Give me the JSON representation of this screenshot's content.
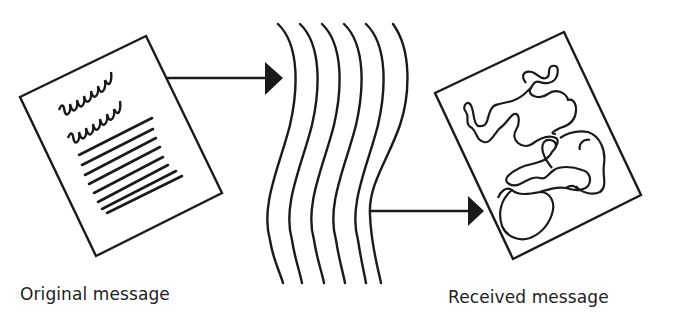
{
  "figure": {
    "type": "communication-noise-diagram",
    "colors": {
      "ink": "#1a1a1a",
      "background": "#ffffff",
      "label": "#222222"
    }
  },
  "nodes": [
    {
      "id": "original",
      "label": "Original message",
      "icon": "document-with-text-icon"
    },
    {
      "id": "channel",
      "label": "",
      "icon": "wavy-lines-noise-icon",
      "wave_count": 6
    },
    {
      "id": "received",
      "label": "Received message",
      "icon": "document-with-scribble-icon"
    }
  ],
  "edges": [
    {
      "from": "original",
      "to": "channel"
    },
    {
      "from": "channel",
      "to": "received"
    }
  ],
  "labels": {
    "original": "Original message",
    "received": "Received message"
  }
}
